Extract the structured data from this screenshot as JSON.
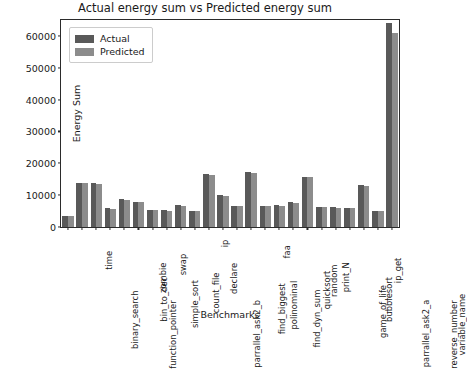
{
  "chart_data": {
    "type": "bar",
    "title": "Actual energy sum vs Predicted energy sum",
    "xlabel": "Benchmarks",
    "ylabel": "Energy Sum",
    "ylim": [
      0,
      65000
    ],
    "yticks": [
      0,
      10000,
      20000,
      30000,
      40000,
      50000,
      60000
    ],
    "ytick_labels": [
      "0",
      "10000",
      "20000",
      "30000",
      "40000",
      "50000",
      "60000"
    ],
    "grid": false,
    "legend_position": "upper left",
    "categories": [
      "binary_search",
      "time",
      "function_pointer",
      "bin_to_dec",
      "zombie",
      "simple_sort",
      "swap",
      "count_file",
      "parrallel_ask2_b",
      "declare",
      "ip",
      "find_biggest",
      "polinominal",
      "find_dyn_sum",
      "faa",
      "quicksort",
      "random",
      "print_N",
      "game_of_life",
      "bubblesort",
      "parrallel_ask2_a",
      "ip_get",
      "reverse_number",
      "variable_name"
    ],
    "series": [
      {
        "name": "Actual",
        "color": "#595959",
        "values": [
          3500,
          13800,
          13900,
          6000,
          8800,
          8000,
          5400,
          5200,
          6900,
          5000,
          16700,
          9900,
          6700,
          17200,
          6700,
          6800,
          7700,
          15800,
          6300,
          6200,
          6100,
          13200,
          5100,
          64000
        ]
      },
      {
        "name": "Predicted",
        "color": "#8c8c8c",
        "values": [
          3400,
          13700,
          13500,
          5800,
          8500,
          7700,
          5300,
          5100,
          6700,
          4900,
          16400,
          9700,
          6600,
          16900,
          6600,
          6700,
          7600,
          15600,
          6200,
          6100,
          6000,
          13000,
          5000,
          61000
        ]
      }
    ]
  },
  "legend": {
    "items": [
      {
        "label": "Actual"
      },
      {
        "label": "Predicted"
      }
    ]
  }
}
